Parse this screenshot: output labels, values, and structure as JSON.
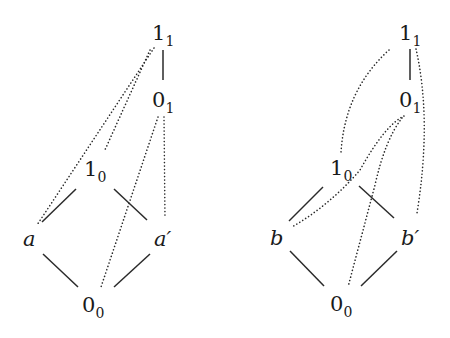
{
  "diagrams": [
    {
      "name": "left-lattice",
      "nodes": {
        "top1": {
          "base": "1",
          "sub": "1",
          "italic": false
        },
        "top0": {
          "base": "0",
          "sub": "1",
          "italic": false
        },
        "mid1": {
          "base": "1",
          "sub": "0",
          "italic": false
        },
        "left": {
          "base": "a",
          "sub": "",
          "italic": true
        },
        "right": {
          "base": "a′",
          "sub": "",
          "italic": true
        },
        "bottom": {
          "base": "0",
          "sub": "0",
          "italic": false
        }
      },
      "solid_edges": [
        [
          "1_1",
          "0_1"
        ],
        [
          "1_0",
          "a"
        ],
        [
          "1_0",
          "a′"
        ],
        [
          "a",
          "0_0"
        ],
        [
          "a′",
          "0_0"
        ]
      ],
      "dotted_edges": [
        [
          "1_1",
          "a"
        ],
        [
          "1_1",
          "1_0"
        ],
        [
          "0_1",
          "0_0"
        ],
        [
          "0_1",
          "a′"
        ]
      ]
    },
    {
      "name": "right-lattice",
      "nodes": {
        "top1": {
          "base": "1",
          "sub": "1",
          "italic": false
        },
        "top0": {
          "base": "0",
          "sub": "1",
          "italic": false
        },
        "mid1": {
          "base": "1",
          "sub": "0",
          "italic": false
        },
        "left": {
          "base": "b",
          "sub": "",
          "italic": true
        },
        "right": {
          "base": "b′",
          "sub": "",
          "italic": true
        },
        "bottom": {
          "base": "0",
          "sub": "0",
          "italic": false
        }
      },
      "solid_edges": [
        [
          "1_1",
          "0_1"
        ],
        [
          "1_0",
          "b"
        ],
        [
          "1_0",
          "b′"
        ],
        [
          "b",
          "0_0"
        ],
        [
          "b′",
          "0_0"
        ]
      ],
      "dotted_edges": [
        [
          "1_1",
          "1_0"
        ],
        [
          "1_1",
          "b′"
        ],
        [
          "0_1",
          "b"
        ],
        [
          "0_1",
          "0_0"
        ]
      ]
    }
  ],
  "colors": {
    "ink": "#2a2a2a",
    "background": "#ffffff"
  }
}
